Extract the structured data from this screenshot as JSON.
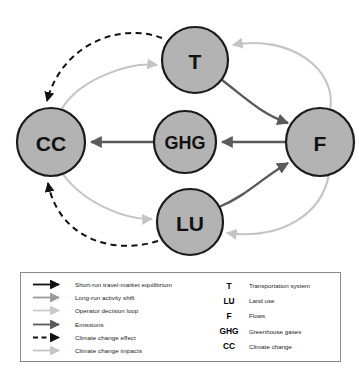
{
  "figure": {
    "type": "diagram",
    "kind": "node-link-feedback-loop",
    "colors": {
      "node_fill": "#b3b3b3",
      "node_stroke": "#1a1a1a",
      "arrow_black": "#111111",
      "arrow_dark_gray": "#5a5a5a",
      "arrow_medium_gray": "#9a9a9a",
      "arrow_light_gray": "#c4c4c4",
      "legend_border": "#8a8a8a",
      "background": "#ffffff"
    }
  },
  "nodes": [
    {
      "id": "T",
      "label": "T",
      "cx": 195,
      "cy": 60,
      "r": 33,
      "font_size": 21
    },
    {
      "id": "CC",
      "label": "CC",
      "cx": 51,
      "cy": 142,
      "r": 34,
      "font_size": 21
    },
    {
      "id": "GHG",
      "label": "GHG",
      "cx": 185,
      "cy": 142,
      "r": 31,
      "font_size": 18
    },
    {
      "id": "F",
      "label": "F",
      "cx": 320,
      "cy": 142,
      "r": 34,
      "font_size": 21
    },
    {
      "id": "LU",
      "label": "LU",
      "cx": 190,
      "cy": 222,
      "r": 33,
      "font_size": 21
    }
  ],
  "edges": [
    {
      "from": "T",
      "to": "F",
      "style": "short-run-travel-market-equilibrium"
    },
    {
      "from": "LU",
      "to": "F",
      "style": "short-run-travel-market-equilibrium"
    },
    {
      "from": "F",
      "to": "T",
      "style": "long-run-activity-shift"
    },
    {
      "from": "F",
      "to": "LU",
      "style": "operator-decision-loop"
    },
    {
      "from": "GHG",
      "to": "CC",
      "style": "emissions"
    },
    {
      "from": "F",
      "to": "GHG",
      "style": "emissions"
    },
    {
      "from": "T",
      "to": "CC",
      "style": "climate-change-effect"
    },
    {
      "from": "LU",
      "to": "CC",
      "style": "climate-change-effect"
    },
    {
      "from": "CC",
      "to": "T",
      "style": "climate-change-impacts"
    },
    {
      "from": "CC",
      "to": "LU",
      "style": "climate-change-impacts"
    }
  ],
  "legend": {
    "line_styles": [
      {
        "label": "Short-run travel-market equilibrium",
        "color": "#111111",
        "dashed": false
      },
      {
        "label": "Long-run activity shift",
        "color": "#9a9a9a",
        "dashed": false
      },
      {
        "label": "Operator decision loop",
        "color": "#c4c4c4",
        "dashed": false
      },
      {
        "label": "Emissions",
        "color": "#5a5a5a",
        "dashed": false
      },
      {
        "label": "Climate change effect",
        "color": "#111111",
        "dashed": true
      },
      {
        "label": "Climate change impacts",
        "color": "#c4c4c4",
        "dashed": false
      }
    ],
    "abbreviations": [
      {
        "key": "T",
        "desc": "Transportation system"
      },
      {
        "key": "LU",
        "desc": "Land use"
      },
      {
        "key": "F",
        "desc": "Flows"
      },
      {
        "key": "GHG",
        "desc": "Greenhouse gases"
      },
      {
        "key": "CC",
        "desc": "Climate change"
      }
    ]
  }
}
